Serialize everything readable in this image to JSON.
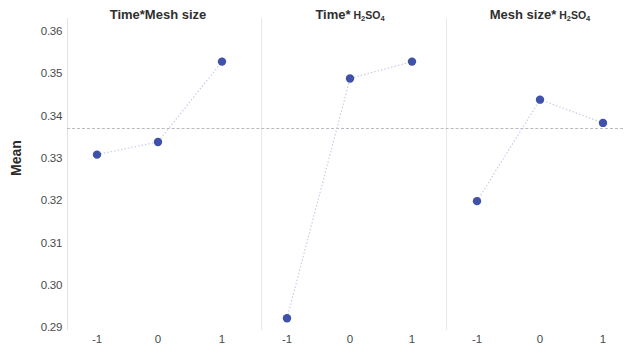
{
  "chart_data": {
    "type": "line",
    "title": "",
    "subtitle": "",
    "xlabel": "",
    "ylabel": "Mean",
    "ylim": [
      0.29,
      0.36
    ],
    "yticks": [
      0.36,
      0.35,
      0.34,
      0.33,
      0.32,
      0.31,
      0.3,
      0.29
    ],
    "ytick_labels": [
      "0.36",
      "0.35",
      "0.34",
      "0.33",
      "0.32",
      "0.31",
      "0.30",
      "0.29"
    ],
    "x": [
      -1,
      0,
      1
    ],
    "xtick_labels": [
      "-1",
      "0",
      "1"
    ],
    "grid": false,
    "legend": "none",
    "marker_color": "#3f51a8",
    "line_color": "#c8cde8",
    "reference_line": {
      "value": 0.3375,
      "style": "dashed",
      "color": "#b9b9c2"
    },
    "panels": [
      {
        "id": "time-mesh-size",
        "title_main": "Time*Mesh size",
        "title_formula": "",
        "values": [
          0.331,
          0.334,
          0.353
        ]
      },
      {
        "id": "time-h2so4",
        "title_main": "Time*",
        "title_formula": "H2SO4",
        "values": [
          0.2923,
          0.349,
          0.353
        ]
      },
      {
        "id": "mesh-size-h2so4",
        "title_main": "Mesh size*",
        "title_formula": "H2SO4",
        "values": [
          0.32,
          0.344,
          0.3385
        ]
      }
    ]
  },
  "axis": {
    "y_label": "Mean"
  },
  "panel_titles": {
    "p1_main": "Time*Mesh size",
    "p2_main": "Time*",
    "p3_main": "Mesh size*"
  },
  "ticks": {
    "y": [
      "0.36",
      "0.35",
      "0.34",
      "0.33",
      "0.32",
      "0.31",
      "0.30",
      "0.29"
    ],
    "x": [
      "-1",
      "0",
      "1"
    ]
  }
}
